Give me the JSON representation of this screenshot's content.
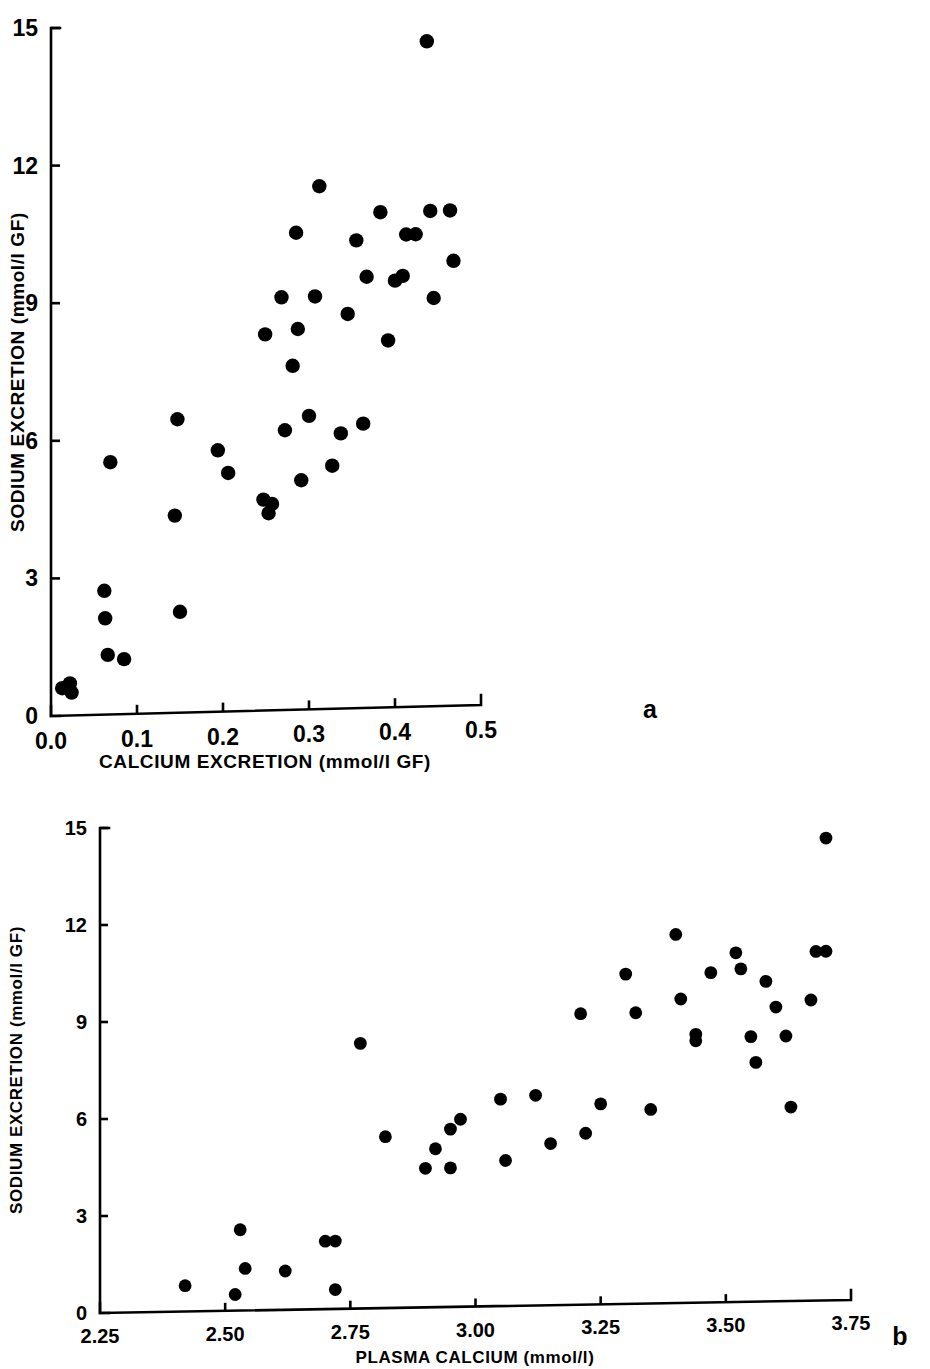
{
  "figure": {
    "background": "#ffffff",
    "ink_color": "#000000",
    "panel_letters": {
      "a": "a",
      "b": "b"
    }
  },
  "chart_data": [
    {
      "id": "panel-a",
      "type": "scatter",
      "title": "",
      "panel_label": "a",
      "xlabel": "CALCIUM EXCRETION (mmol/l GF)",
      "ylabel": "SODIUM EXCRETION (mmol/l GF)",
      "xlim": [
        0.0,
        0.5
      ],
      "ylim": [
        0,
        15
      ],
      "xticks": [
        0.0,
        0.1,
        0.2,
        0.3,
        0.4,
        0.5
      ],
      "xticklabels": [
        "0.0",
        "0.1",
        "0.2",
        "0.3",
        "0.4",
        "0.5"
      ],
      "yticks": [
        0,
        3,
        6,
        9,
        12,
        15
      ],
      "yticklabels": [
        "0",
        "3",
        "6",
        "9",
        "12",
        "15"
      ],
      "grid": false,
      "legend": "none",
      "marker": "filled-circle",
      "marker_color": "#000000",
      "points": [
        {
          "x": 0.013,
          "y": 0.6
        },
        {
          "x": 0.022,
          "y": 0.7
        },
        {
          "x": 0.024,
          "y": 0.5
        },
        {
          "x": 0.062,
          "y": 2.7
        },
        {
          "x": 0.063,
          "y": 2.1
        },
        {
          "x": 0.066,
          "y": 1.3
        },
        {
          "x": 0.069,
          "y": 5.5
        },
        {
          "x": 0.085,
          "y": 1.2
        },
        {
          "x": 0.144,
          "y": 4.3
        },
        {
          "x": 0.147,
          "y": 6.4
        },
        {
          "x": 0.15,
          "y": 2.2
        },
        {
          "x": 0.194,
          "y": 5.7
        },
        {
          "x": 0.206,
          "y": 5.2
        },
        {
          "x": 0.247,
          "y": 4.6
        },
        {
          "x": 0.249,
          "y": 8.2
        },
        {
          "x": 0.253,
          "y": 4.3
        },
        {
          "x": 0.257,
          "y": 4.5
        },
        {
          "x": 0.268,
          "y": 9.0
        },
        {
          "x": 0.272,
          "y": 6.1
        },
        {
          "x": 0.281,
          "y": 7.5
        },
        {
          "x": 0.285,
          "y": 10.4
        },
        {
          "x": 0.287,
          "y": 8.3
        },
        {
          "x": 0.291,
          "y": 5.0
        },
        {
          "x": 0.3,
          "y": 6.4
        },
        {
          "x": 0.307,
          "y": 9.0
        },
        {
          "x": 0.312,
          "y": 11.4
        },
        {
          "x": 0.327,
          "y": 5.3
        },
        {
          "x": 0.337,
          "y": 6.0
        },
        {
          "x": 0.345,
          "y": 8.6
        },
        {
          "x": 0.355,
          "y": 10.2
        },
        {
          "x": 0.363,
          "y": 6.2
        },
        {
          "x": 0.367,
          "y": 9.4
        },
        {
          "x": 0.383,
          "y": 10.8
        },
        {
          "x": 0.392,
          "y": 8.0
        },
        {
          "x": 0.4,
          "y": 9.3
        },
        {
          "x": 0.409,
          "y": 9.4
        },
        {
          "x": 0.413,
          "y": 10.3
        },
        {
          "x": 0.424,
          "y": 10.3
        },
        {
          "x": 0.437,
          "y": 14.5
        },
        {
          "x": 0.441,
          "y": 10.8
        },
        {
          "x": 0.445,
          "y": 8.9
        },
        {
          "x": 0.464,
          "y": 10.8
        },
        {
          "x": 0.468,
          "y": 9.7
        }
      ]
    },
    {
      "id": "panel-b",
      "type": "scatter",
      "title": "",
      "panel_label": "b",
      "xlabel": "PLASMA CALCIUM (mmol/l)",
      "ylabel": "SODIUM EXCRETION (mmol/l GF)",
      "xlim": [
        2.25,
        3.75
      ],
      "ylim": [
        0,
        15
      ],
      "xticks": [
        2.25,
        2.5,
        2.75,
        3.0,
        3.25,
        3.5,
        3.75
      ],
      "xticklabels": [
        "2.25",
        "2.50",
        "2.75",
        "3.00",
        "3.25",
        "3.50",
        "3.75"
      ],
      "yticks": [
        0,
        3,
        6,
        9,
        12,
        15
      ],
      "yticklabels": [
        "0",
        "3",
        "6",
        "9",
        "12",
        "15"
      ],
      "grid": false,
      "legend": "none",
      "marker": "filled-circle",
      "marker_color": "#000000",
      "points": [
        {
          "x": 2.42,
          "y": 0.8
        },
        {
          "x": 2.52,
          "y": 0.5
        },
        {
          "x": 2.53,
          "y": 2.5
        },
        {
          "x": 2.54,
          "y": 1.3
        },
        {
          "x": 2.62,
          "y": 1.2
        },
        {
          "x": 2.7,
          "y": 2.1
        },
        {
          "x": 2.72,
          "y": 2.1
        },
        {
          "x": 2.72,
          "y": 0.6
        },
        {
          "x": 2.77,
          "y": 8.2
        },
        {
          "x": 2.82,
          "y": 5.3
        },
        {
          "x": 2.9,
          "y": 4.3
        },
        {
          "x": 2.92,
          "y": 4.9
        },
        {
          "x": 2.95,
          "y": 5.5
        },
        {
          "x": 2.95,
          "y": 4.3
        },
        {
          "x": 2.97,
          "y": 5.8
        },
        {
          "x": 3.05,
          "y": 6.4
        },
        {
          "x": 3.06,
          "y": 4.5
        },
        {
          "x": 3.12,
          "y": 6.5
        },
        {
          "x": 3.15,
          "y": 5.0
        },
        {
          "x": 3.21,
          "y": 9.0
        },
        {
          "x": 3.22,
          "y": 5.3
        },
        {
          "x": 3.25,
          "y": 6.2
        },
        {
          "x": 3.3,
          "y": 10.2
        },
        {
          "x": 3.32,
          "y": 9.0
        },
        {
          "x": 3.35,
          "y": 6.0
        },
        {
          "x": 3.4,
          "y": 11.4
        },
        {
          "x": 3.41,
          "y": 9.4
        },
        {
          "x": 3.44,
          "y": 8.3
        },
        {
          "x": 3.44,
          "y": 8.1
        },
        {
          "x": 3.47,
          "y": 10.2
        },
        {
          "x": 3.52,
          "y": 10.8
        },
        {
          "x": 3.53,
          "y": 10.3
        },
        {
          "x": 3.55,
          "y": 8.2
        },
        {
          "x": 3.56,
          "y": 7.4
        },
        {
          "x": 3.58,
          "y": 9.9
        },
        {
          "x": 3.6,
          "y": 9.1
        },
        {
          "x": 3.62,
          "y": 8.2
        },
        {
          "x": 3.63,
          "y": 6.0
        },
        {
          "x": 3.67,
          "y": 9.3
        },
        {
          "x": 3.68,
          "y": 10.8
        },
        {
          "x": 3.7,
          "y": 10.8
        },
        {
          "x": 3.7,
          "y": 14.3
        }
      ]
    }
  ]
}
